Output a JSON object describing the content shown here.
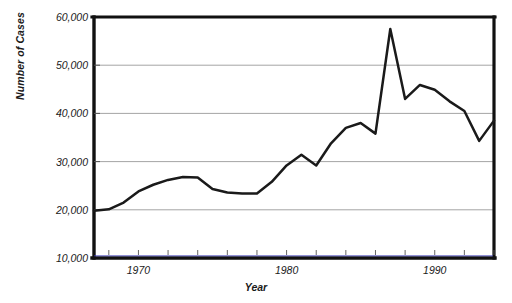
{
  "chart_data": {
    "type": "line",
    "title": "",
    "xlabel": "Year",
    "ylabel": "Number of Cases",
    "xlim": [
      1967,
      1994
    ],
    "ylim": [
      10000,
      60000
    ],
    "grid": true,
    "legend": null,
    "y_ticks": [
      "10,000",
      "20,000",
      "30,000",
      "40,000",
      "50,000",
      "60,000"
    ],
    "y_tick_values": [
      10000,
      20000,
      30000,
      40000,
      50000,
      60000
    ],
    "x_ticks": [
      "1970",
      "1980",
      "1990"
    ],
    "x_tick_values": [
      1970,
      1980,
      1990
    ],
    "x_minor_tick_values": [
      1968,
      1970,
      1972,
      1974,
      1976,
      1978,
      1980,
      1982,
      1984,
      1986,
      1988,
      1990,
      1992,
      1994
    ],
    "x": [
      1967,
      1968,
      1969,
      1970,
      1971,
      1972,
      1973,
      1974,
      1975,
      1976,
      1977,
      1978,
      1979,
      1980,
      1981,
      1982,
      1983,
      1984,
      1985,
      1986,
      1987,
      1988,
      1989,
      1990,
      1991,
      1992,
      1993,
      1994
    ],
    "values": [
      19800,
      20100,
      21500,
      23800,
      25200,
      26200,
      26800,
      26700,
      24300,
      23600,
      23400,
      23400,
      25800,
      29200,
      31400,
      29200,
      33800,
      37000,
      38000,
      35800,
      57500,
      43000,
      45900,
      44900,
      42500,
      40500,
      34300,
      38500
    ],
    "series": [
      {
        "name": "Number of Cases",
        "values": [
          19800,
          20100,
          21500,
          23800,
          25200,
          26200,
          26800,
          26700,
          24300,
          23600,
          23400,
          23400,
          25800,
          29200,
          31400,
          29200,
          33800,
          37000,
          38000,
          35800,
          57500,
          43000,
          45900,
          44900,
          42500,
          40500,
          34300,
          38500
        ],
        "color": "#1a1a1a"
      }
    ]
  },
  "colors": {
    "line": "#1a1a1a",
    "axis": "#111111",
    "grid": "#9a9a9a",
    "baseline_accent": "#3a3ab4",
    "background": "#ffffff"
  }
}
